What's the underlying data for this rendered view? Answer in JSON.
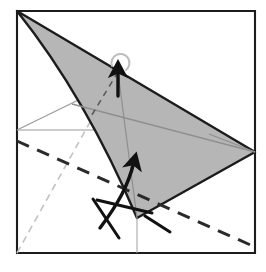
{
  "figure": {
    "kind": "origami-fold-diagram",
    "title": "",
    "caption": "",
    "background_color": "#ffffff",
    "canvas": {
      "width": 266,
      "height": 272
    }
  },
  "colors": {
    "paper_white": "#ffffff",
    "paper_shaded": "#b6b6b6",
    "outline_dark": "#1c1c1c",
    "crease_thin_gray": "#9a9a9a",
    "crease_faint_gray": "#c9c9c9",
    "arrow_black": "#111111",
    "valley_dash": "#2a2a2a"
  },
  "shapes": {
    "square_sheet": {
      "name": "square-sheet-outline",
      "points": "17,11 255,11 255,253 17,253",
      "stroke": "#1c1c1c",
      "stroke_width": 2.1,
      "fill": "#ffffff"
    },
    "shaded_flap": {
      "name": "shaded-flap",
      "path": "M17,11 C 64,70 104,140 137,218 L 255,152 Z",
      "fill": "#b6b6b6",
      "stroke": "#1c1c1c",
      "stroke_width": 2.4
    }
  },
  "creases": [
    {
      "name": "crease-thin-horizontal-left",
      "type": "thin-gray",
      "d": "M17,130 L 120,130",
      "stroke": "#9a9a9a",
      "stroke_width": 1.2
    },
    {
      "name": "crease-thin-diagonal-upper-left",
      "type": "thin-gray",
      "d": "M17,130 L 103,88",
      "stroke": "#9a9a9a",
      "stroke_width": 1.2
    },
    {
      "name": "crease-thin-long-diagonal",
      "type": "thin-gray",
      "d": "M72,104 L 255,152",
      "stroke": "#8f8f8f",
      "stroke_width": 1.3
    },
    {
      "name": "crease-thin-right-short",
      "type": "thin-gray",
      "d": "M209,134 L 255,152",
      "stroke": "#8f8f8f",
      "stroke_width": 1.3
    },
    {
      "name": "crease-thin-vertical-center",
      "type": "thin-gray",
      "d": "M118,72 L 137,218",
      "stroke": "#8f8f8f",
      "stroke_width": 1.2
    },
    {
      "name": "crease-thin-vertical-tail",
      "type": "thin-gray",
      "d": "M137,218 L 137,253",
      "stroke": "#a8a8a8",
      "stroke_width": 1.1
    }
  ],
  "fold_lines": [
    {
      "name": "valley-fold-main-dashed",
      "type": "valley-dashed-bold",
      "d": "M17,141 L 255,247",
      "stroke": "#2a2a2a",
      "stroke_width": 3.0,
      "dash": "13 9"
    },
    {
      "name": "hidden-crease-dashed-faint",
      "type": "hidden-dashed-faint",
      "d": "M17,253 L 118,72",
      "stroke": "#c2c2c2",
      "stroke_width": 1.6,
      "dash": "7 5"
    },
    {
      "name": "hidden-crease-dashed-dark",
      "type": "hidden-dashed-dark",
      "d": "M118,72 L 90,118",
      "stroke": "#5a5a5a",
      "stroke_width": 1.6,
      "dash": "6 5"
    }
  ],
  "arrows": [
    {
      "name": "fold-arrow-curved-upward",
      "type": "curved-fold-arrow",
      "path": "M100,228 C 118,204 128,186 134,162",
      "head_at": "134,156",
      "head_angle_deg": -15,
      "stroke": "#111111",
      "stroke_width": 3.4
    },
    {
      "name": "fold-arrow-tail-crossing",
      "type": "straight-tail",
      "path": "M97,200 L 152,213",
      "stroke": "#111111",
      "stroke_width": 3.0
    },
    {
      "name": "fold-arrow-tail-lower-left",
      "type": "straight-tail",
      "path": "M93,199 L 119,238",
      "stroke": "#111111",
      "stroke_width": 3.0
    },
    {
      "name": "fold-arrow-tail-lower-right",
      "type": "straight-tail",
      "path": "M145,216 L 170,232",
      "stroke": "#111111",
      "stroke_width": 3.0
    },
    {
      "name": "fold-unfold-arrow-vertical",
      "type": "fold-and-unfold-arrow",
      "path": "M118,96 L 118,70",
      "head_at": "118,64",
      "stroke": "#111111",
      "stroke_width": 3.4
    },
    {
      "name": "fold-unfold-loop-icon",
      "type": "return-loop",
      "path": "M112,66 A 9 9 0 1 1 126,70",
      "stroke": "#bdbdbd",
      "stroke_width": 2.0
    }
  ],
  "legend": {
    "valley_fold_label": "valley fold (dashed)",
    "shaded_side_label": "colored side of paper",
    "arrow_label": "fold in direction of arrow",
    "loop_label": "fold and unfold"
  }
}
